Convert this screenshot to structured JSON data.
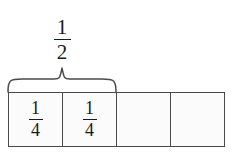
{
  "diagram": {
    "type": "fraction-bar-model",
    "background_color": "#ffffff",
    "border_color": "#4a4a4a",
    "cell_fill_color": "#fbfbfb",
    "text_color": "#1a1a1a"
  },
  "brace_label": {
    "name": "one-half",
    "numerator": "1",
    "denominator": "2",
    "spans_cells": 2
  },
  "brace": {
    "name": "curly-brace",
    "color": "#4a4a4a"
  },
  "bar": {
    "total_cells": 4,
    "cells": [
      {
        "numerator": "1",
        "denominator": "4",
        "shaded": false,
        "labeled": true
      },
      {
        "numerator": "1",
        "denominator": "4",
        "shaded": false,
        "labeled": true
      },
      {
        "numerator": "",
        "denominator": "",
        "shaded": false,
        "labeled": false
      },
      {
        "numerator": "",
        "denominator": "",
        "shaded": false,
        "labeled": false
      }
    ]
  }
}
